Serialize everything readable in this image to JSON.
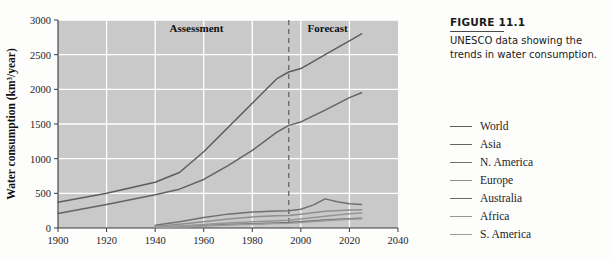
{
  "figure": {
    "number": "FIGURE 11.1",
    "caption": "UNESCO data showing the trends in water consumption."
  },
  "chart_data": {
    "type": "line",
    "title": "",
    "xlabel": "",
    "ylabel": "Water consumption (km³/year)",
    "xlim": [
      1900,
      2040
    ],
    "ylim": [
      0,
      3000
    ],
    "xticks": [
      1900,
      1920,
      1940,
      1960,
      1980,
      2000,
      2020,
      2040
    ],
    "yticks": [
      0,
      500,
      1000,
      1500,
      2000,
      2500,
      3000
    ],
    "grid": true,
    "legend_position": "right-outside",
    "plot_background": "#c9c9c9",
    "grid_color": "#ffffff",
    "annotations": [
      {
        "text": "Assessment",
        "x": 1957,
        "y": 2830
      },
      {
        "text": "Forecast",
        "x": 2011,
        "y": 2830
      }
    ],
    "divider": {
      "type": "vertical-dashed",
      "x": 1995,
      "color": "#6f6f6f"
    },
    "series": [
      {
        "name": "World",
        "color": "#5d5d5d",
        "x": [
          1900,
          1920,
          1940,
          1950,
          1960,
          1970,
          1980,
          1990,
          1995,
          2000,
          2010,
          2020,
          2025
        ],
        "values": [
          370,
          500,
          660,
          800,
          1100,
          1450,
          1800,
          2150,
          2250,
          2300,
          2500,
          2700,
          2800
        ]
      },
      {
        "name": "Asia",
        "color": "#636363",
        "x": [
          1900,
          1920,
          1940,
          1950,
          1960,
          1970,
          1980,
          1990,
          1995,
          2000,
          2010,
          2020,
          2025
        ],
        "values": [
          210,
          340,
          480,
          560,
          700,
          900,
          1120,
          1380,
          1480,
          1530,
          1700,
          1880,
          1950
        ]
      },
      {
        "name": "N. America",
        "color": "#707070",
        "x": [
          1940,
          1950,
          1960,
          1970,
          1980,
          1990,
          1995,
          2000,
          2005,
          2010,
          2015,
          2020,
          2025
        ],
        "values": [
          40,
          90,
          150,
          200,
          230,
          245,
          250,
          270,
          330,
          420,
          380,
          350,
          340
        ]
      },
      {
        "name": "Europe",
        "color": "#8f8f8f",
        "x": [
          1940,
          1950,
          1960,
          1970,
          1980,
          1990,
          1995,
          2000,
          2010,
          2020,
          2025
        ],
        "values": [
          25,
          55,
          90,
          130,
          160,
          175,
          180,
          200,
          240,
          260,
          265
        ]
      },
      {
        "name": "Australia",
        "color": "#6a6a6a",
        "x": [
          1940,
          1950,
          1960,
          1970,
          1980,
          1990,
          1995,
          2000,
          2010,
          2020,
          2025
        ],
        "values": [
          10,
          20,
          35,
          50,
          62,
          72,
          78,
          90,
          115,
          135,
          140
        ]
      },
      {
        "name": "Africa",
        "color": "#969696",
        "x": [
          1940,
          1950,
          1960,
          1970,
          1980,
          1990,
          1995,
          2000,
          2010,
          2020,
          2025
        ],
        "values": [
          15,
          30,
          50,
          72,
          90,
          105,
          112,
          130,
          170,
          205,
          215
        ]
      },
      {
        "name": "S. America",
        "color": "#9c9c9c",
        "x": [
          1940,
          1950,
          1960,
          1970,
          1980,
          1990,
          1995,
          2000,
          2010,
          2020,
          2025
        ],
        "values": [
          8,
          15,
          28,
          42,
          55,
          65,
          70,
          80,
          105,
          125,
          132
        ]
      }
    ]
  }
}
